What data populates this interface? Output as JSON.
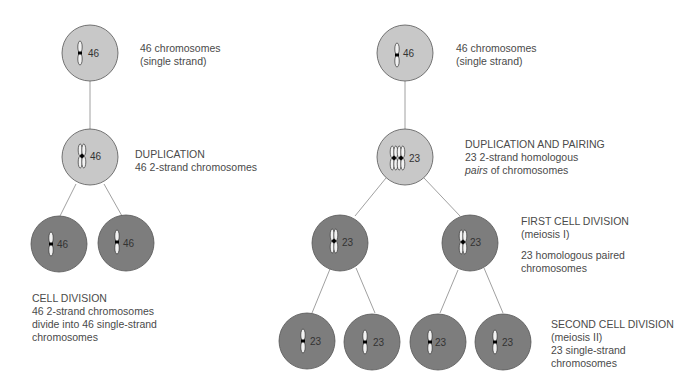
{
  "diagram": {
    "colors": {
      "light_cell": "#c8c8c8",
      "dark_cell": "#7d7d7d",
      "outline": "#555555",
      "connector": "#888888",
      "text": "#4a4a4a"
    },
    "mitosis": {
      "stage1": {
        "count": "46",
        "label_line1": "46 chromosomes",
        "label_line2": "(single strand)"
      },
      "stage2": {
        "count": "46",
        "label_line1": "DUPLICATION",
        "label_line2": "46 2-strand chromosomes"
      },
      "stage3": {
        "counts": [
          "46",
          "46"
        ],
        "label_line1": "CELL DIVISION",
        "label_line2": "46 2-strand chromosomes",
        "label_line3": "divide into 46 single-strand",
        "label_line4": "chromosomes"
      }
    },
    "meiosis": {
      "stage1": {
        "count": "46",
        "label_line1": "46 chromosomes",
        "label_line2": "(single strand)"
      },
      "stage2": {
        "count": "23",
        "label_line1": "DUPLICATION AND PAIRING",
        "label_line2": "23 2-strand homologous",
        "label_line3_italic": "pairs",
        "label_line3_rest": " of chromosomes"
      },
      "stage3": {
        "counts": [
          "23",
          "23"
        ],
        "label_line1": "FIRST CELL DIVISION",
        "label_line2": "(meiosis I)",
        "label_line3": "23 homologous paired",
        "label_line4": "chromosomes"
      },
      "stage4": {
        "counts": [
          "23",
          "23",
          "23",
          "23"
        ],
        "label_line1": "SECOND CELL DIVISION",
        "label_line2": "(meiosis II)",
        "label_line3": "23 single-strand",
        "label_line4": "chromosomes"
      }
    }
  }
}
